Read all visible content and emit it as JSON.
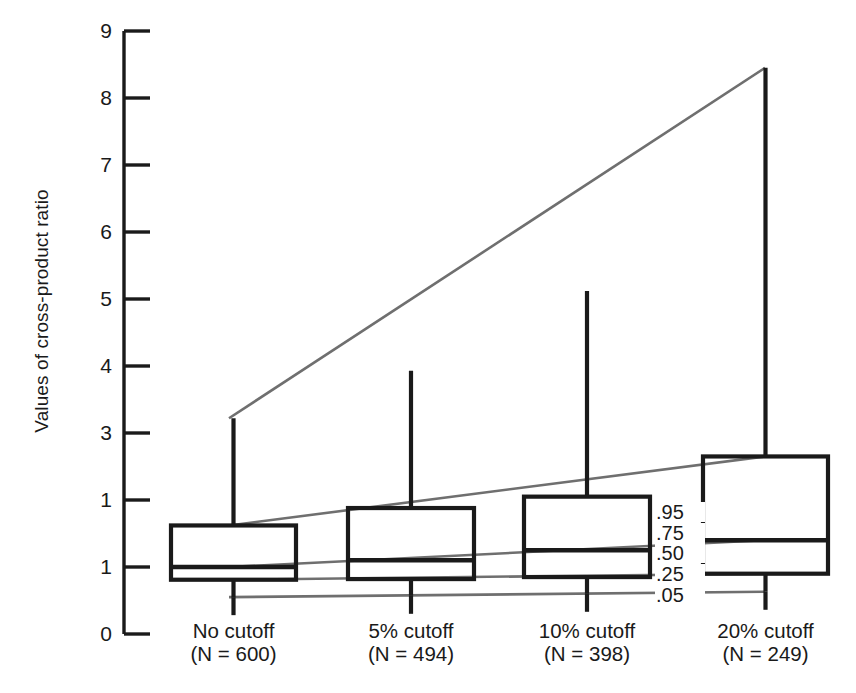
{
  "chart_data": {
    "type": "box",
    "title": "",
    "xlabel": "",
    "ylabel": "Values of cross-product ratio",
    "ylim": [
      0,
      9
    ],
    "yticks": [
      "0",
      "1",
      "1",
      "3",
      "4",
      "5",
      "6",
      "7",
      "8",
      "9"
    ],
    "ytick_values": [
      0,
      1,
      2,
      3,
      4,
      5,
      6,
      7,
      8,
      9
    ],
    "grid": false,
    "legend_position": "none",
    "categories": [
      "No cutoff",
      "5% cutoff",
      "10% cutoff",
      "20% cutoff"
    ],
    "category_counts": [
      "(N = 600)",
      "(N = 494)",
      "(N = 398)",
      "(N = 249)"
    ],
    "percentile_labels": [
      ".95",
      ".75",
      ".50",
      ".25",
      ".05"
    ],
    "series": [
      {
        "name": "No cutoff",
        "n": 600,
        "p05": 0.55,
        "p25": 0.81,
        "p50": 1.0,
        "p75": 1.62,
        "p95": 3.22
      },
      {
        "name": "5% cutoff",
        "n": 494,
        "p05": 0.57,
        "p25": 0.82,
        "p50": 1.1,
        "p75": 1.88,
        "p95": 3.93
      },
      {
        "name": "10% cutoff",
        "n": 398,
        "p05": 0.6,
        "p25": 0.85,
        "p50": 1.25,
        "p75": 2.05,
        "p95": 5.12
      },
      {
        "name": "20% cutoff",
        "n": 249,
        "p05": 0.63,
        "p25": 0.9,
        "p50": 1.4,
        "p75": 2.65,
        "p95": 8.45
      }
    ]
  },
  "colors": {
    "line": "#1a1a1a",
    "leader": "#6f6f6f",
    "background": "#ffffff"
  }
}
